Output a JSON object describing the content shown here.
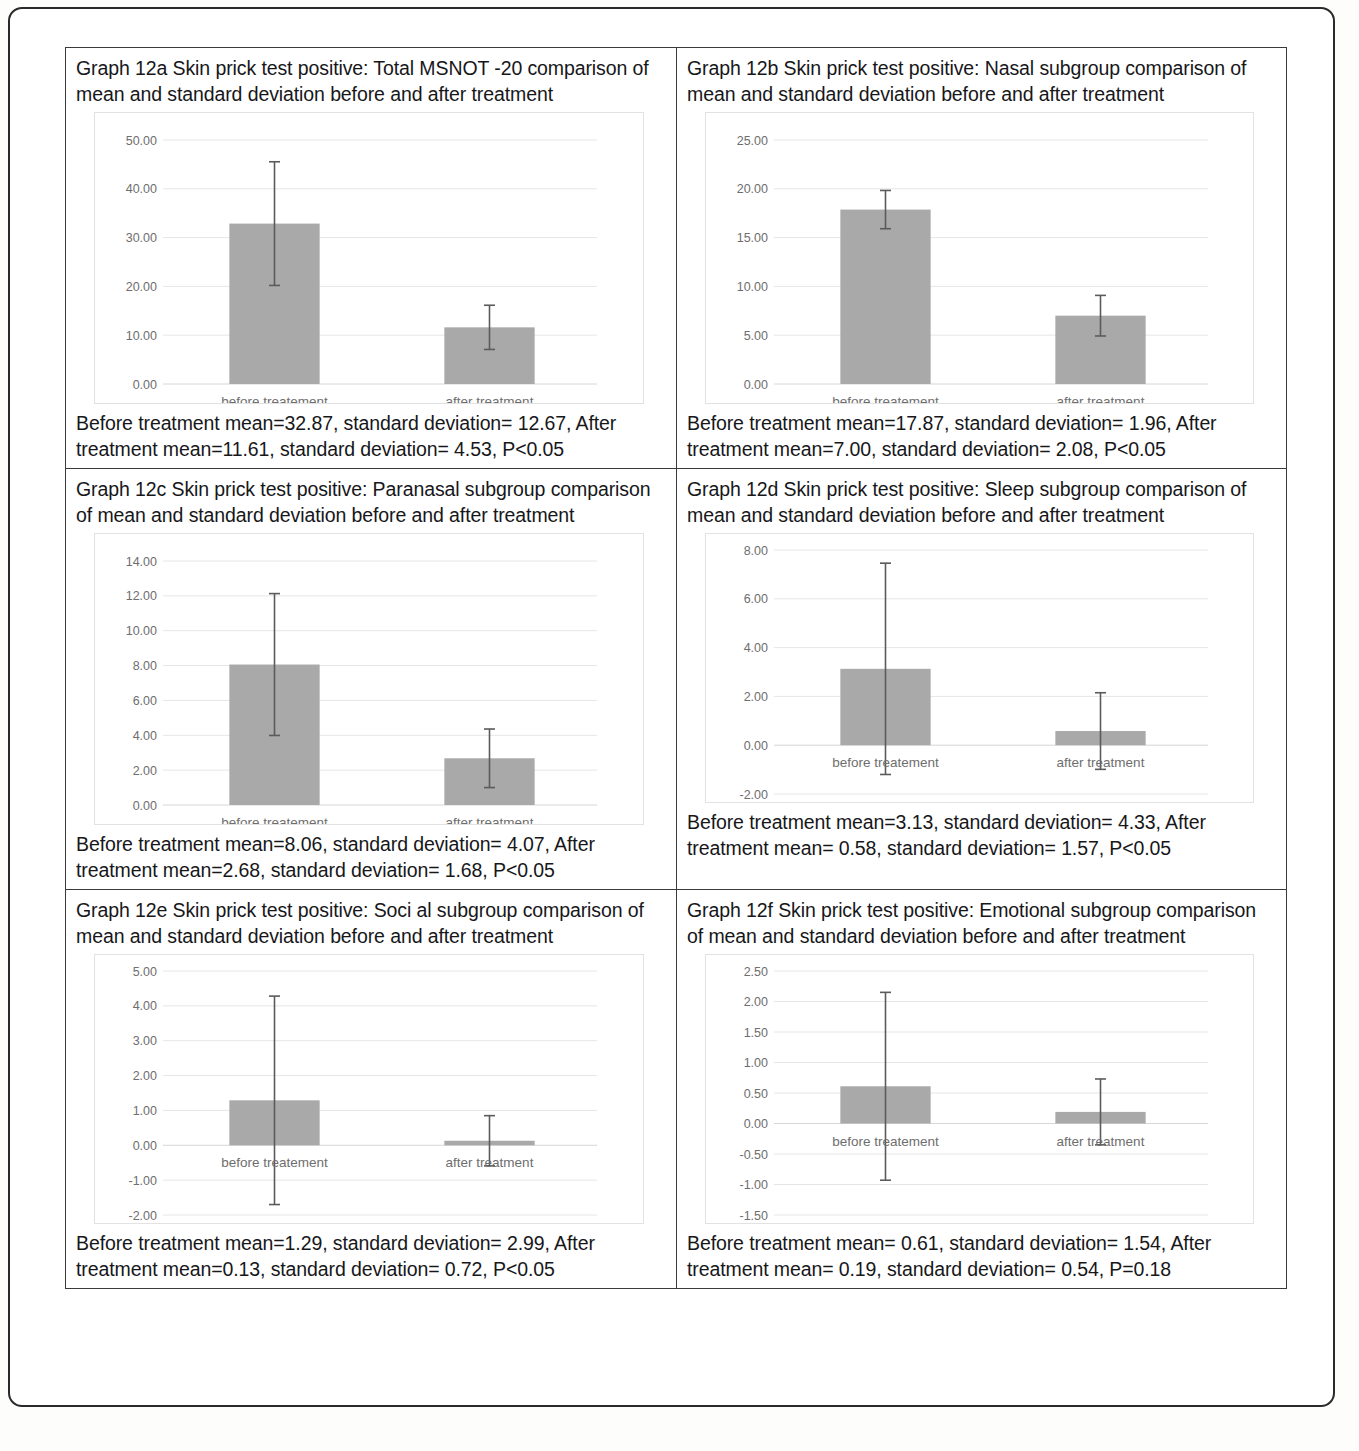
{
  "document": {
    "figure_group": "Graph 12",
    "outer_frame": true
  },
  "style": {
    "bar_color": "#a9a9a9",
    "error_bar_color": "#5b5b5b",
    "gridline_color": "#e6e6e6",
    "axis_text_color": "#6e6e6e",
    "text_color": "#17171a"
  },
  "panels": [
    {
      "id": "12a",
      "title": "Graph 12a Skin prick test positive: Total MSNOT -20 comparison of mean and standard deviation before and after treatment",
      "caption": "Before treatment mean=32.87, standard deviation= 12.67, After treatment mean=11.61, standard deviation= 4.53, P<0.05",
      "chart_data": {
        "type": "bar",
        "title": "",
        "xlabel": "",
        "ylabel": "",
        "categories": [
          "before treatement",
          "after treatment"
        ],
        "values": [
          32.87,
          11.61
        ],
        "errors": [
          12.67,
          4.53
        ],
        "ylim": [
          0,
          50
        ],
        "yticks": [
          0,
          10,
          20,
          30,
          40,
          50
        ],
        "ytick_labels": [
          "0.00",
          "10.00",
          "20.00",
          "30.00",
          "40.00",
          "50.00"
        ],
        "grid": true,
        "legend": "none",
        "labels_inside": false
      }
    },
    {
      "id": "12b",
      "title": "Graph 12b Skin prick test positive: Nasal subgroup comparison of mean and standard deviation before and after treatment",
      "caption": "Before treatment mean=17.87, standard deviation= 1.96, After treatment mean=7.00, standard deviation= 2.08, P<0.05",
      "chart_data": {
        "type": "bar",
        "title": "",
        "xlabel": "",
        "ylabel": "",
        "categories": [
          "before treatement",
          "after treatment"
        ],
        "values": [
          17.87,
          7.0
        ],
        "errors": [
          1.96,
          2.08
        ],
        "ylim": [
          0,
          25
        ],
        "yticks": [
          0,
          5,
          10,
          15,
          20,
          25
        ],
        "ytick_labels": [
          "0.00",
          "5.00",
          "10.00",
          "15.00",
          "20.00",
          "25.00"
        ],
        "grid": true,
        "legend": "none",
        "labels_inside": false
      }
    },
    {
      "id": "12c",
      "title": "Graph 12c Skin prick test positive: Paranasal subgroup comparison of mean and standard deviation before and after treatment",
      "caption": "Before treatment mean=8.06, standard deviation= 4.07, After treatment mean=2.68, standard deviation= 1.68, P<0.05",
      "chart_data": {
        "type": "bar",
        "title": "",
        "xlabel": "",
        "ylabel": "",
        "categories": [
          "before treatement",
          "after treatment"
        ],
        "values": [
          8.06,
          2.68
        ],
        "errors": [
          4.07,
          1.68
        ],
        "ylim": [
          0,
          14
        ],
        "yticks": [
          0,
          2,
          4,
          6,
          8,
          10,
          12,
          14
        ],
        "ytick_labels": [
          "0.00",
          "2.00",
          "4.00",
          "6.00",
          "8.00",
          "10.00",
          "12.00",
          "14.00"
        ],
        "grid": true,
        "legend": "none",
        "labels_inside": false
      }
    },
    {
      "id": "12d",
      "title": "Graph 12d Skin prick test positive: Sleep subgroup comparison of mean and standard deviation before and after treatment",
      "caption": "Before treatment mean=3.13, standard deviation= 4.33, After treatment mean= 0.58, standard deviation= 1.57, P<0.05",
      "chart_data": {
        "type": "bar",
        "title": "",
        "xlabel": "",
        "ylabel": "",
        "categories": [
          "before treatement",
          "after treatment"
        ],
        "values": [
          3.13,
          0.58
        ],
        "errors": [
          4.33,
          1.57
        ],
        "ylim": [
          -2,
          8
        ],
        "yticks": [
          -2,
          0,
          2,
          4,
          6,
          8
        ],
        "ytick_labels": [
          "-2.00",
          "0.00",
          "2.00",
          "4.00",
          "6.00",
          "8.00"
        ],
        "grid": true,
        "legend": "none",
        "labels_inside": true
      }
    },
    {
      "id": "12e",
      "title": "Graph 12e Skin prick test positive: Soci al subgroup comparison of mean and standard deviation before and after treatment",
      "caption": "Before treatment mean=1.29, standard deviation= 2.99, After treatment mean=0.13, standard deviation= 0.72, P<0.05",
      "chart_data": {
        "type": "bar",
        "title": "",
        "xlabel": "",
        "ylabel": "",
        "categories": [
          "before treatement",
          "after treatment"
        ],
        "values": [
          1.29,
          0.13
        ],
        "errors": [
          2.99,
          0.72
        ],
        "ylim": [
          -2,
          5
        ],
        "yticks": [
          -2,
          -1,
          0,
          1,
          2,
          3,
          4,
          5
        ],
        "ytick_labels": [
          "-2.00",
          "-1.00",
          "0.00",
          "1.00",
          "2.00",
          "3.00",
          "4.00",
          "5.00"
        ],
        "grid": true,
        "legend": "none",
        "labels_inside": true
      }
    },
    {
      "id": "12f",
      "title": "Graph 12f Skin prick test positive: Emotional subgroup comparison of mean and standard deviation before and after treatment",
      "caption": "Before treatment mean= 0.61, standard deviation= 1.54, After treatment mean= 0.19, standard deviation= 0.54, P=0.18",
      "chart_data": {
        "type": "bar",
        "title": "",
        "xlabel": "",
        "ylabel": "",
        "categories": [
          "before treatement",
          "after treatment"
        ],
        "values": [
          0.61,
          0.19
        ],
        "errors": [
          1.54,
          0.54
        ],
        "ylim": [
          -1.5,
          2.5
        ],
        "yticks": [
          -1.5,
          -1,
          -0.5,
          0,
          0.5,
          1,
          1.5,
          2,
          2.5
        ],
        "ytick_labels": [
          "-1.50",
          "-1.00",
          "-0.50",
          "0.00",
          "0.50",
          "1.00",
          "1.50",
          "2.00",
          "2.50"
        ],
        "grid": true,
        "legend": "none",
        "labels_inside": true
      }
    }
  ]
}
